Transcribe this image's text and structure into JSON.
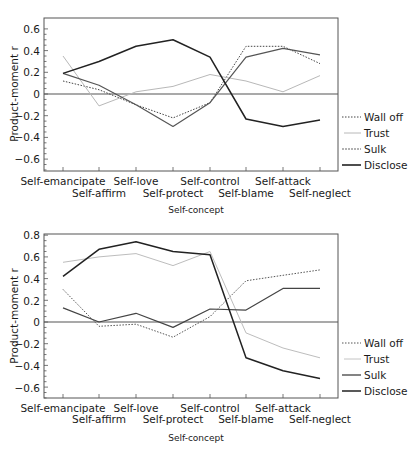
{
  "chart_data": [
    {
      "type": "line",
      "title": "",
      "xlabel": "Self-concept",
      "ylabel": "Product-moment r",
      "ylim": [
        -0.7,
        0.7
      ],
      "yticks": [
        0.6,
        0.4,
        0.2,
        0,
        -0.2,
        -0.4,
        -0.6
      ],
      "ytick_labels": [
        "0.6",
        "0.4",
        "0.2",
        "0",
        "−0.2",
        "−0.4",
        "−0.6"
      ],
      "grid": false,
      "zero_line": true,
      "legend_position": "right",
      "categories": [
        "Self-emancipate",
        "Self-affirm",
        "Self-love",
        "Self-protect",
        "Self-control",
        "Self-blame",
        "Self-attack",
        "Self-neglect"
      ],
      "series": [
        {
          "name": "Wall off",
          "style": "dotted",
          "color": "#444444",
          "values": [
            0.12,
            0.04,
            -0.1,
            -0.22,
            -0.08,
            0.44,
            0.44,
            0.28
          ]
        },
        {
          "name": "Trust",
          "style": "solid-light",
          "color": "#b8b8b8",
          "values": [
            0.35,
            -0.11,
            0.02,
            0.07,
            0.18,
            0.12,
            0.02,
            0.17
          ]
        },
        {
          "name": "Sulk",
          "style": "solid-medium",
          "color": "#555555",
          "values": [
            0.19,
            0.08,
            -0.1,
            -0.3,
            -0.08,
            0.34,
            0.42,
            0.36
          ]
        },
        {
          "name": "Disclose",
          "style": "solid-dark",
          "color": "#222222",
          "values": [
            0.19,
            0.3,
            0.44,
            0.5,
            0.34,
            -0.23,
            -0.3,
            -0.24
          ]
        }
      ]
    },
    {
      "type": "line",
      "title": "",
      "xlabel": "Self-concept",
      "ylabel": "Product-moment r",
      "ylim": [
        -0.7,
        0.8
      ],
      "yticks": [
        0.8,
        0.6,
        0.4,
        0.2,
        0,
        -0.2,
        -0.4,
        -0.6
      ],
      "ytick_labels": [
        "0.8",
        "0.6",
        "0.4",
        "0.2",
        "0",
        "−0.2",
        "−0.4",
        "−0.6"
      ],
      "grid": false,
      "zero_line": true,
      "legend_position": "right",
      "categories": [
        "Self-emancipate",
        "Self-affirm",
        "Self-love",
        "Self-protect",
        "Self-control",
        "Self-blame",
        "Self-attack",
        "Self-neglect"
      ],
      "series": [
        {
          "name": "Wall off",
          "style": "dotted",
          "color": "#555555",
          "values": [
            0.3,
            -0.04,
            -0.02,
            -0.14,
            0.05,
            0.38,
            0.43,
            0.48
          ]
        },
        {
          "name": "Trust",
          "style": "solid-light",
          "color": "#bdbdbd",
          "values": [
            0.55,
            0.6,
            0.63,
            0.52,
            0.65,
            -0.1,
            -0.24,
            -0.33
          ]
        },
        {
          "name": "Sulk",
          "style": "solid-medium",
          "color": "#444444",
          "values": [
            0.13,
            0.0,
            0.08,
            -0.05,
            0.12,
            0.11,
            0.31,
            0.31
          ]
        },
        {
          "name": "Disclose",
          "style": "solid-dark",
          "color": "#222222",
          "values": [
            0.42,
            0.67,
            0.74,
            0.65,
            0.62,
            -0.33,
            -0.45,
            -0.52
          ]
        }
      ]
    }
  ],
  "charts": [
    {
      "ylabel": "Product-moment r",
      "xlabel": "Self-concept",
      "ticks": [
        "0.6",
        "0.4",
        "0.2",
        "0",
        "−0.2",
        "−0.4",
        "−0.6"
      ],
      "cats_upper": [
        "Self-emancipate",
        "Self-love",
        "Self-control",
        "Self-attack"
      ],
      "cats_lower": [
        "Self-affirm",
        "Self-protect",
        "Self-blame",
        "Self-neglect"
      ],
      "legend": [
        "Wall off",
        "Trust",
        "Sulk",
        "Disclose"
      ]
    },
    {
      "ylabel": "Product-moment r",
      "xlabel": "Self-concept",
      "ticks": [
        "0.8",
        "0.6",
        "0.4",
        "0.2",
        "0",
        "−0.2",
        "−0.4",
        "−0.6"
      ],
      "cats_upper": [
        "Self-emancipate",
        "Self-love",
        "Self-control",
        "Self-attack"
      ],
      "cats_lower": [
        "Self-affirm",
        "Self-protect",
        "Self-blame",
        "Self-neglect"
      ],
      "legend": [
        "Wall off",
        "Trust",
        "Sulk",
        "Disclose"
      ]
    }
  ]
}
